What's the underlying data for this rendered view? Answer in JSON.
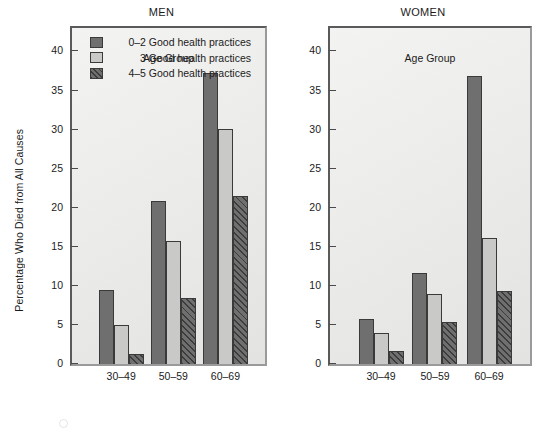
{
  "figure": {
    "ylabel": "Percentage Who Died from All Causes",
    "xlabel": "Age Group",
    "legend": [
      {
        "label": "0–2 Good health practices",
        "swatch": "solid-dark-gray",
        "color": "#6f6f6f"
      },
      {
        "label": "3 Good health practices",
        "swatch": "solid-light-gray",
        "color": "#c9c9c7"
      },
      {
        "label": "4–5 Good health practices",
        "swatch": "diagonal-hatch-dark",
        "color": "#6f6f6f"
      }
    ],
    "yticks": [
      "0",
      "5",
      "10",
      "15",
      "20",
      "25",
      "30",
      "35",
      "40"
    ],
    "panels": [
      {
        "title": "MEN"
      },
      {
        "title": "WOMEN"
      }
    ]
  },
  "chart_data": [
    {
      "type": "bar",
      "title": "MEN",
      "xlabel": "Age Group",
      "ylabel": "Percentage Who Died from All Causes",
      "categories": [
        "30–49",
        "50–59",
        "60–69"
      ],
      "ylim": [
        0,
        43
      ],
      "yticks": [
        0,
        5,
        10,
        15,
        20,
        25,
        30,
        35,
        40
      ],
      "grid": false,
      "legend_position": "top-left-inside",
      "series": [
        {
          "name": "0–2 Good health practices",
          "values": [
            9.5,
            20.8,
            37.3
          ],
          "color": "#6f6f6f"
        },
        {
          "name": "3 Good health practices",
          "values": [
            5.0,
            15.8,
            30.1
          ],
          "color": "#c9c9c7"
        },
        {
          "name": "4–5 Good health practices",
          "values": [
            1.3,
            8.5,
            21.5
          ],
          "color": "#6f6f6f"
        }
      ]
    },
    {
      "type": "bar",
      "title": "WOMEN",
      "xlabel": "Age Group",
      "ylabel": "Percentage Who Died from All Causes",
      "categories": [
        "30–49",
        "50–59",
        "60–69"
      ],
      "ylim": [
        0,
        43
      ],
      "yticks": [
        0,
        5,
        10,
        15,
        20,
        25,
        30,
        35,
        40
      ],
      "grid": false,
      "legend_position": "none",
      "series": [
        {
          "name": "0–2 Good health practices",
          "values": [
            5.7,
            11.6,
            36.8
          ],
          "color": "#6f6f6f"
        },
        {
          "name": "3 Good health practices",
          "values": [
            4.0,
            9.0,
            16.1
          ],
          "color": "#c9c9c7"
        },
        {
          "name": "4–5 Good health practices",
          "values": [
            1.7,
            5.4,
            9.4
          ],
          "color": "#6f6f6f"
        }
      ]
    }
  ]
}
